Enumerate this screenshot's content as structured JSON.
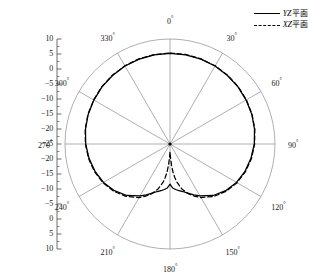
{
  "figure": {
    "type": "polar-radiation-pattern",
    "degree_symbol": "°"
  },
  "legend": {
    "position": "top-right",
    "entries": [
      {
        "label": "YZ平面",
        "italic_prefix": "YZ",
        "cjk_suffix": "平面",
        "style": "solid",
        "name": "yz-plane"
      },
      {
        "label": "XZ平面",
        "italic_prefix": "XZ",
        "cjk_suffix": "平面",
        "style": "dashed",
        "name": "xz-plane"
      }
    ]
  },
  "radial_axis": {
    "labels": [
      "10",
      "5",
      "0",
      "−5",
      "−10",
      "−15",
      "−20",
      "−25",
      "−20",
      "−15",
      "−10",
      "−5",
      "0",
      "5",
      "10"
    ],
    "center_value": -25,
    "outer_value": 10,
    "tick_step": 5,
    "unit": "dB"
  },
  "angular_axis": {
    "labels": [
      "0",
      "30",
      "60",
      "90",
      "120",
      "150",
      "180",
      "210",
      "240",
      "270",
      "300",
      "330"
    ],
    "step": 30,
    "start": 0,
    "direction": "clockwise"
  },
  "chart_data": {
    "type": "line",
    "title": "",
    "xlabel": "",
    "ylabel": "",
    "polar": true,
    "rlim": [
      -25,
      10
    ],
    "rticks": [
      -25,
      -20,
      -15,
      -10,
      -5,
      0,
      5,
      10
    ],
    "theta_unit": "degree",
    "grid": true,
    "legend_position": "top-right",
    "theta": [
      0,
      10,
      20,
      30,
      40,
      50,
      60,
      70,
      80,
      90,
      100,
      110,
      120,
      130,
      140,
      150,
      155,
      160,
      165,
      170,
      172,
      174,
      176,
      178,
      180,
      182,
      184,
      186,
      188,
      190,
      195,
      200,
      205,
      210,
      220,
      230,
      240,
      250,
      260,
      270,
      280,
      290,
      300,
      310,
      320,
      330,
      340,
      350,
      360
    ],
    "series": [
      {
        "name": "YZ平面",
        "style": "solid",
        "color": "#000000",
        "values": [
          5.2,
          5.2,
          5.1,
          5.0,
          4.8,
          4.6,
          4.3,
          4.0,
          3.6,
          3.1,
          2.4,
          1.6,
          0.6,
          -0.8,
          -2.6,
          -5.0,
          -6.3,
          -7.6,
          -8.6,
          -9.3,
          -9.6,
          -9.9,
          -10.2,
          -10.9,
          -11.6,
          -10.9,
          -10.2,
          -9.9,
          -9.6,
          -9.3,
          -8.6,
          -7.6,
          -6.3,
          -5.0,
          -2.6,
          -0.8,
          0.6,
          1.6,
          2.4,
          3.1,
          3.6,
          4.0,
          4.3,
          4.6,
          4.8,
          5.0,
          5.1,
          5.2,
          5.2
        ]
      },
      {
        "name": "XZ平面",
        "style": "dashed",
        "color": "#000000",
        "values": [
          5.3,
          5.3,
          5.2,
          5.1,
          4.9,
          4.7,
          4.4,
          4.1,
          3.7,
          3.2,
          2.6,
          1.8,
          0.8,
          -0.5,
          -2.2,
          -4.4,
          -5.8,
          -7.4,
          -9.4,
          -12.2,
          -13.8,
          -15.7,
          -18.0,
          -20.6,
          -22.4,
          -20.6,
          -18.0,
          -15.7,
          -13.8,
          -12.2,
          -9.4,
          -7.4,
          -5.8,
          -4.4,
          -2.2,
          -0.5,
          0.8,
          1.8,
          2.6,
          3.2,
          3.7,
          4.1,
          4.4,
          4.7,
          4.9,
          5.1,
          5.2,
          5.3,
          5.3
        ]
      }
    ]
  },
  "colors": {
    "curve": "#000000",
    "grid": "#8d8d8d",
    "axis": "#4a4a4a",
    "text": "#1a1a1a",
    "background": "#ffffff"
  }
}
